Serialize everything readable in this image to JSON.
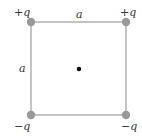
{
  "diagram": {
    "side_label_top": "a",
    "side_label_left": "a",
    "charges": [
      {
        "position": "top-left",
        "label": "+q"
      },
      {
        "position": "top-right",
        "label": "+q"
      },
      {
        "position": "bottom-left",
        "label": "−q"
      },
      {
        "position": "bottom-right",
        "label": "−q"
      }
    ],
    "center_point": "dot",
    "colors": {
      "square_line": "#8a8a8a",
      "charge_fill": "#999999",
      "center_dot": "#111111",
      "text": "#333333"
    }
  }
}
